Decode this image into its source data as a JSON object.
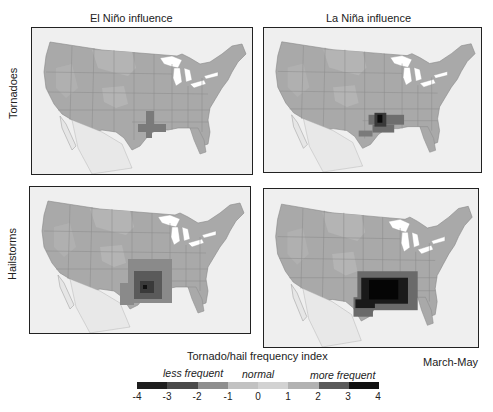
{
  "columns": [
    {
      "title": "El Niño influence"
    },
    {
      "title": "La Niña influence"
    }
  ],
  "rows": [
    {
      "label": "Tornadoes"
    },
    {
      "label": "Hailstorms"
    }
  ],
  "panels": [
    {
      "id": "tornado-el-nino",
      "row": "Tornadoes",
      "column": "El Niño influence",
      "hotspot": "southern Plains (OK/N. TX)",
      "max_index": 2
    },
    {
      "id": "tornado-la-nina",
      "row": "Tornadoes",
      "column": "La Niña influence",
      "hotspot": "Ozarks / mid-South (AR/MO/OK)",
      "max_index": 4
    },
    {
      "id": "hail-el-nino",
      "row": "Hailstorms",
      "column": "El Niño influence",
      "hotspot": "southern Plains (OK/TX/KS/AR)",
      "max_index": 3
    },
    {
      "id": "hail-la-nina",
      "row": "Hailstorms",
      "column": "La Niña influence",
      "hotspot": "southern Plains to lower Mississippi valley",
      "max_index": 4
    }
  ],
  "legend": {
    "title": "Tornado/hail frequency index",
    "season": "March-May",
    "less_label": "less frequent",
    "normal_label": "normal",
    "more_label": "more frequent",
    "ticks": [
      "-4",
      "-3",
      "-2",
      "-1",
      "0",
      "1",
      "2",
      "3",
      "4"
    ],
    "colors": [
      "#1e1e1e",
      "#3c3c3c",
      "#8e8e8e",
      "#b8b8b8",
      "#cfcfcf",
      "#b0b0b0",
      "#6e6e6e",
      "#2a2a2a",
      "#0a0a0a"
    ]
  },
  "colors": {
    "land": "#a9a9a9",
    "land_light": "#b9b9b9",
    "ocean_outside": "#f4f4f4",
    "lakes": "#ffffff",
    "border": "#222222"
  }
}
